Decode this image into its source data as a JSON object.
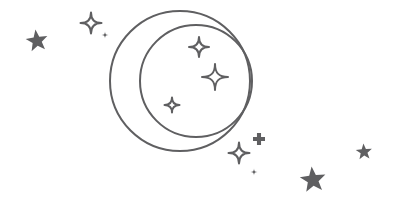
{
  "artwork": {
    "title": "Crescent moon with stars line illustration",
    "background_color": "#ffffff",
    "stroke_color": "#5f5f61",
    "fill_color": "#5f5f61",
    "stroke_width": 2,
    "canvas": {
      "width": 397,
      "height": 214
    }
  },
  "moon": {
    "name": "crescent-moon",
    "style": "outline",
    "outer_circle": {
      "cx": 180,
      "cy": 81,
      "r": 70
    },
    "inner_circle": {
      "cx": 196,
      "cy": 81,
      "r": 56
    }
  },
  "stars": [
    {
      "id": "star-filled-left",
      "name": "five-point-star-filled-left",
      "shape": "five-point-star",
      "style": "filled",
      "cx": 37,
      "cy": 41,
      "size": 23,
      "rotation": -8
    },
    {
      "id": "sparkle-outline-top-left",
      "name": "four-point-sparkle-outline-top-left",
      "shape": "four-point-sparkle",
      "style": "outline",
      "cx": 91,
      "cy": 23,
      "size": 21,
      "rotation": 0
    },
    {
      "id": "dot-top-left",
      "name": "tiny-sparkle-dot-top-left",
      "shape": "four-point-sparkle",
      "style": "filled",
      "cx": 105,
      "cy": 35,
      "size": 7,
      "rotation": 0
    },
    {
      "id": "sparkle-moon-upper",
      "name": "four-point-sparkle-moon-upper",
      "shape": "four-point-sparkle",
      "style": "outline",
      "cx": 199,
      "cy": 47,
      "size": 20,
      "rotation": 0
    },
    {
      "id": "sparkle-moon-middle",
      "name": "four-point-sparkle-moon-middle",
      "shape": "four-point-sparkle",
      "style": "outline",
      "cx": 215,
      "cy": 77,
      "size": 26,
      "rotation": 0
    },
    {
      "id": "sparkle-moon-lower",
      "name": "four-point-sparkle-moon-lower",
      "shape": "four-point-sparkle",
      "style": "outline",
      "cx": 172,
      "cy": 105,
      "size": 15,
      "rotation": 0
    },
    {
      "id": "sparkle-bottom-cluster",
      "name": "four-point-sparkle-bottom-cluster",
      "shape": "four-point-sparkle",
      "style": "outline",
      "cx": 239,
      "cy": 153,
      "size": 21,
      "rotation": 0
    },
    {
      "id": "plus-bottom-cluster",
      "name": "four-point-plus-filled-bottom-cluster",
      "shape": "plus-cross",
      "style": "filled",
      "cx": 259,
      "cy": 139,
      "size": 12,
      "rotation": 0
    },
    {
      "id": "dot-bottom-cluster",
      "name": "tiny-sparkle-dot-bottom-cluster",
      "shape": "four-point-sparkle",
      "style": "filled",
      "cx": 254,
      "cy": 172,
      "size": 7,
      "rotation": 0
    },
    {
      "id": "star-filled-bottom-right",
      "name": "five-point-star-filled-bottom-right",
      "shape": "five-point-star",
      "style": "filled",
      "cx": 313,
      "cy": 180,
      "size": 27,
      "rotation": -6
    },
    {
      "id": "star-filled-far-right",
      "name": "five-point-star-filled-far-right",
      "shape": "five-point-star",
      "style": "filled",
      "cx": 364,
      "cy": 152,
      "size": 17,
      "rotation": -4
    }
  ]
}
